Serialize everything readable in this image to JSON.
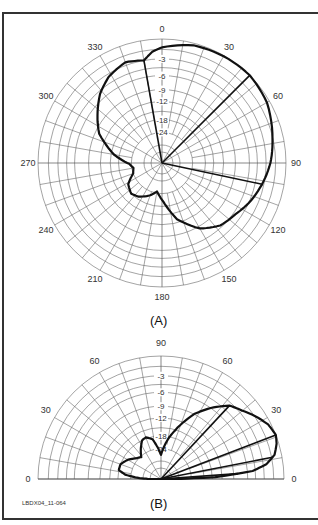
{
  "figure": {
    "footer_id": "LBDX04_11-064",
    "panel_a": {
      "caption": "(A)"
    },
    "panel_b": {
      "caption": "(B)"
    }
  },
  "chart_data": [
    {
      "type": "polar",
      "title": "(A) Azimuth pattern",
      "angle_ticks": [
        0,
        30,
        60,
        90,
        120,
        150,
        180,
        210,
        240,
        270,
        300,
        330
      ],
      "angle_labels": [
        "0",
        "30",
        "60",
        "90",
        "120",
        "150",
        "180",
        "210",
        "240",
        "270",
        "300",
        "330"
      ],
      "radial_ticks_db": [
        -3,
        -6,
        -9,
        -12,
        -18,
        -24
      ],
      "radial_labels": [
        "-3",
        "-6",
        "-9",
        "-12",
        "-18",
        "-24"
      ],
      "radial_scale": "ARRL log-periodic (0 dB at outer ring)",
      "grid": true,
      "series": [
        {
          "name": "pattern",
          "points_deg_db": [
            [
              0,
              -1.2
            ],
            [
              15,
              -0.3
            ],
            [
              30,
              -0.1
            ],
            [
              45,
              0
            ],
            [
              60,
              -0.4
            ],
            [
              78,
              -1.6
            ],
            [
              90,
              -2.3
            ],
            [
              102,
              -3.3
            ],
            [
              115,
              -4.5
            ],
            [
              125,
              -5.6
            ],
            [
              137,
              -6.4
            ],
            [
              150,
              -8.5
            ],
            [
              165,
              -13
            ],
            [
              178,
              -20
            ],
            [
              190,
              -25
            ],
            [
              200,
              -22
            ],
            [
              215,
              -19
            ],
            [
              225,
              -18
            ],
            [
              238,
              -19.5
            ],
            [
              250,
              -24
            ],
            [
              260,
              -25
            ],
            [
              268,
              -23
            ],
            [
              280,
              -16
            ],
            [
              295,
              -10
            ],
            [
              304,
              -8
            ],
            [
              318,
              -5
            ],
            [
              328,
              -3.5
            ],
            [
              340,
              -2.5
            ],
            [
              350,
              -3
            ],
            [
              355,
              -1.8
            ]
          ]
        }
      ],
      "reference_lines_deg": [
        350,
        45,
        102
      ],
      "annotations": [
        "-3 dB at ~350°",
        "peak at ~45°",
        "-3 dB at ~102°"
      ]
    },
    {
      "type": "polar",
      "title": "(B) Elevation pattern",
      "angle_ticks": [
        0,
        30,
        60,
        90,
        120,
        150,
        180
      ],
      "angle_labels": [
        "0",
        "30",
        "60",
        "90",
        "60",
        "30",
        "0"
      ],
      "radial_ticks_db": [
        -3,
        -6,
        -9,
        -12,
        -18,
        -24
      ],
      "radial_labels": [
        "-3",
        "-6",
        "-9",
        "-12",
        "-18",
        "-24"
      ],
      "radial_scale": "ARRL log-periodic (0 dB at outer ring)",
      "grid": true,
      "series": [
        {
          "name": "pattern",
          "points_deg_db": [
            [
              0,
              -40
            ],
            [
              2,
              -14
            ],
            [
              5,
              -5
            ],
            [
              8,
              -2.5
            ],
            [
              12,
              -1
            ],
            [
              17,
              -0.3
            ],
            [
              21,
              0
            ],
            [
              27,
              -0.4
            ],
            [
              33,
              -1.3
            ],
            [
              40,
              -2.5
            ],
            [
              47,
              -3.5
            ],
            [
              55,
              -6
            ],
            [
              63,
              -9
            ],
            [
              72,
              -14
            ],
            [
              80,
              -19
            ],
            [
              86,
              -24
            ],
            [
              90,
              -28
            ],
            [
              95,
              -24
            ],
            [
              102,
              -19
            ],
            [
              110,
              -17.5
            ],
            [
              116,
              -18
            ],
            [
              124,
              -21
            ],
            [
              132,
              -24.5
            ],
            [
              140,
              -23
            ],
            [
              150,
              -20
            ],
            [
              160,
              -18
            ],
            [
              168,
              -18
            ],
            [
              173,
              -21
            ],
            [
              177,
              -28
            ],
            [
              180,
              -40
            ]
          ]
        }
      ],
      "reference_lines_deg": [
        47,
        21,
        11,
        4
      ],
      "annotations": [
        "upper -3 dB ~47°",
        "peak ~21°",
        "11°",
        "4°"
      ]
    }
  ]
}
